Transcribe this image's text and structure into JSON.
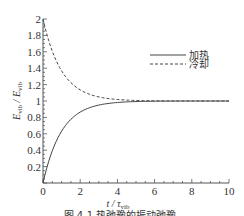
{
  "chart_data": {
    "type": "line",
    "title": "",
    "xlabel": "t / τ_vib",
    "xlabel_main": "t / τ",
    "xlabel_sub": "vib",
    "ylabel": "E_vib / E_vib",
    "ylabel_main": "E",
    "ylabel_sub": "vib",
    "xlim": [
      0,
      10
    ],
    "ylim": [
      0,
      2
    ],
    "xticks": [
      0,
      2,
      4,
      6,
      8,
      10
    ],
    "xtick_labels": [
      "0",
      "2",
      "4",
      "6",
      "8",
      "10"
    ],
    "yticks": [
      0.2,
      0.4,
      0.6,
      0.8,
      1,
      1.2,
      1.4,
      1.6,
      1.8,
      2
    ],
    "ytick_labels": [
      "0.2",
      "0.4",
      "0.6",
      "0.8",
      "1",
      "1.2",
      "1.4",
      "1.6",
      "1.8",
      "2"
    ],
    "legend_position": "top-right",
    "grid": false,
    "series": [
      {
        "name": "加热",
        "style": "solid",
        "x": [
          0,
          0.5,
          1,
          1.5,
          2,
          2.5,
          3,
          3.5,
          4,
          5,
          6,
          7,
          8,
          9,
          10
        ],
        "values": [
          0,
          0.39,
          0.63,
          0.78,
          0.86,
          0.92,
          0.95,
          0.97,
          0.98,
          0.99,
          1.0,
          1.0,
          1.0,
          1.0,
          1.0
        ]
      },
      {
        "name": "冷却",
        "style": "dashed",
        "x": [
          0,
          0.5,
          1,
          1.5,
          2,
          2.5,
          3,
          3.5,
          4,
          5,
          6,
          7,
          8,
          9,
          10
        ],
        "values": [
          2,
          1.61,
          1.37,
          1.22,
          1.14,
          1.08,
          1.05,
          1.03,
          1.02,
          1.01,
          1.0,
          1.0,
          1.0,
          1.0,
          1.0
        ]
      }
    ],
    "caption": "图 4-1  热弛豫的振动弛豫"
  }
}
